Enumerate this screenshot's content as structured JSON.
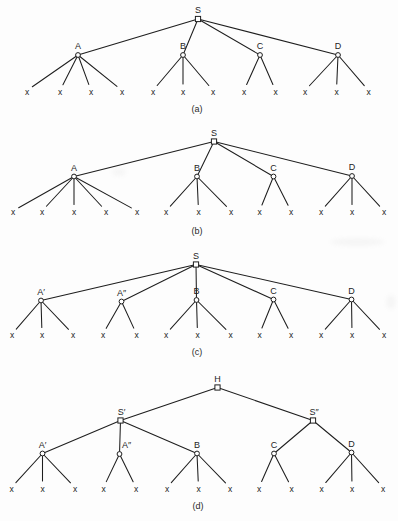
{
  "figure": {
    "background": "#fdfdfd",
    "ink": "#1e1e1e",
    "node_fill": "#ffffff",
    "leaf_glyph": "x",
    "panels": [
      {
        "id": "a",
        "caption": "(a)",
        "caption_x": 197,
        "caption_y": 109,
        "nodes": [
          {
            "id": "S",
            "label": "S",
            "x": 198,
            "y": 19,
            "shape": "square"
          },
          {
            "id": "A",
            "label": "A",
            "x": 78,
            "y": 55,
            "shape": "circle"
          },
          {
            "id": "B",
            "label": "B",
            "x": 183,
            "y": 55,
            "shape": "circle"
          },
          {
            "id": "C",
            "label": "C",
            "x": 260,
            "y": 55,
            "shape": "circle"
          },
          {
            "id": "D",
            "label": "D",
            "x": 338,
            "y": 55,
            "shape": "circle"
          }
        ],
        "edges": [
          [
            "S",
            "A"
          ],
          [
            "S",
            "B"
          ],
          [
            "S",
            "C"
          ],
          [
            "S",
            "D"
          ]
        ],
        "leaf_y": 91.5,
        "leaves": [
          {
            "parent": "A",
            "xs": [
              27,
              60,
              91,
              122
            ]
          },
          {
            "parent": "B",
            "xs": [
              153,
              183,
              213
            ]
          },
          {
            "parent": "C",
            "xs": [
              244,
              275.5
            ]
          },
          {
            "parent": "D",
            "xs": [
              305,
              336.5,
              368.5
            ]
          }
        ]
      },
      {
        "id": "b",
        "caption": "(b)",
        "caption_x": 197,
        "caption_y": 230.5,
        "nodes": [
          {
            "id": "S",
            "label": "S",
            "x": 214,
            "y": 141.5,
            "shape": "square"
          },
          {
            "id": "A",
            "label": "A",
            "x": 74,
            "y": 176.5,
            "shape": "circle"
          },
          {
            "id": "B",
            "label": "B",
            "x": 197,
            "y": 176.5,
            "shape": "circle"
          },
          {
            "id": "C",
            "label": "C",
            "x": 273.5,
            "y": 176.5,
            "shape": "circle"
          },
          {
            "id": "D",
            "label": "D",
            "x": 352,
            "y": 176,
            "shape": "circle"
          }
        ],
        "edges": [
          [
            "S",
            "A"
          ],
          [
            "S",
            "B"
          ],
          [
            "S",
            "C"
          ],
          [
            "S",
            "D"
          ]
        ],
        "leaf_y": 212,
        "leaves": [
          {
            "parent": "A",
            "xs": [
              13,
              42,
              74,
              106,
              137
            ]
          },
          {
            "parent": "B",
            "xs": [
              166,
              198.5,
              231
            ]
          },
          {
            "parent": "C",
            "xs": [
              259.5,
              291
            ]
          },
          {
            "parent": "D",
            "xs": [
              321,
              352,
              384
            ]
          }
        ]
      },
      {
        "id": "c",
        "caption": "(c)",
        "caption_x": 197,
        "caption_y": 351.5,
        "nodes": [
          {
            "id": "S",
            "label": "S",
            "x": 196,
            "y": 264.5,
            "shape": "square"
          },
          {
            "id": "Ap",
            "label": "A′",
            "x": 41,
            "y": 300.5,
            "shape": "circle"
          },
          {
            "id": "App",
            "label": "A″",
            "x": 121.5,
            "y": 301.5,
            "shape": "circle"
          },
          {
            "id": "B",
            "label": "B",
            "x": 196.5,
            "y": 300,
            "shape": "circle"
          },
          {
            "id": "C",
            "label": "C",
            "x": 273.5,
            "y": 299.5,
            "shape": "circle"
          },
          {
            "id": "D",
            "label": "D",
            "x": 351.5,
            "y": 299.5,
            "shape": "circle"
          }
        ],
        "edges": [
          [
            "S",
            "Ap"
          ],
          [
            "S",
            "App"
          ],
          [
            "S",
            "B"
          ],
          [
            "S",
            "C"
          ],
          [
            "S",
            "D"
          ]
        ],
        "leaf_y": 335,
        "leaves": [
          {
            "parent": "Ap",
            "xs": [
              12,
              42,
              73
            ]
          },
          {
            "parent": "App",
            "xs": [
              103,
              136.5
            ]
          },
          {
            "parent": "B",
            "xs": [
              166,
              197.5,
              230.5
            ]
          },
          {
            "parent": "C",
            "xs": [
              259.5,
              291
            ]
          },
          {
            "parent": "D",
            "xs": [
              321,
              352,
              384
            ]
          }
        ]
      },
      {
        "id": "d",
        "caption": "(d)",
        "caption_x": 198,
        "caption_y": 506,
        "nodes": [
          {
            "id": "H",
            "label": "H",
            "x": 217.5,
            "y": 387.5,
            "shape": "square"
          },
          {
            "id": "Sp",
            "label": "S′",
            "x": 120.5,
            "y": 420.5,
            "shape": "square",
            "label_dx": 1
          },
          {
            "id": "Spp",
            "label": "S″",
            "x": 313,
            "y": 420.5,
            "shape": "square",
            "label_dx": 1
          },
          {
            "id": "Ap",
            "label": "A′",
            "x": 42.5,
            "y": 453.5,
            "shape": "circle"
          },
          {
            "id": "App",
            "label": "A″",
            "x": 119.5,
            "y": 454,
            "shape": "circle",
            "label_dx": 7
          },
          {
            "id": "B",
            "label": "B",
            "x": 197,
            "y": 453.5,
            "shape": "circle"
          },
          {
            "id": "C",
            "label": "C",
            "x": 274,
            "y": 453.5,
            "shape": "circle"
          },
          {
            "id": "D",
            "label": "D",
            "x": 351.5,
            "y": 452.5,
            "shape": "circle"
          }
        ],
        "edges": [
          [
            "H",
            "Sp"
          ],
          [
            "H",
            "Spp"
          ],
          [
            "Sp",
            "Ap"
          ],
          [
            "Sp",
            "App"
          ],
          [
            "Sp",
            "B"
          ],
          [
            "Spp",
            "C"
          ],
          [
            "Spp",
            "D"
          ]
        ],
        "leaf_y": 488.5,
        "leaves": [
          {
            "parent": "Ap",
            "xs": [
              11.5,
              42.5,
              75
            ]
          },
          {
            "parent": "App",
            "xs": [
              103.5,
              136
            ]
          },
          {
            "parent": "B",
            "xs": [
              167,
              198.5,
              230
            ]
          },
          {
            "parent": "C",
            "xs": [
              259,
              291.5
            ]
          },
          {
            "parent": "D",
            "xs": [
              321.5,
              352,
              383
            ]
          }
        ]
      }
    ]
  }
}
